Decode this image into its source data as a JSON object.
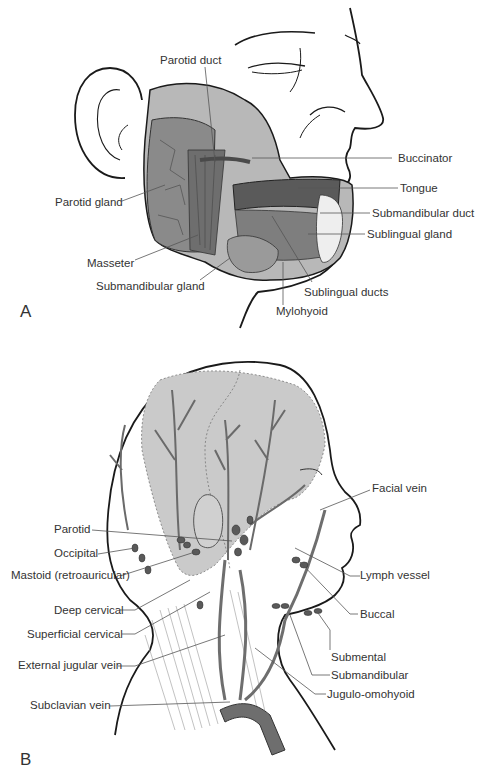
{
  "panel_a": {
    "letter": "A",
    "labels": {
      "parotid_duct": "Parotid duct",
      "buccinator": "Buccinator",
      "tongue": "Tongue",
      "parotid_gland": "Parotid gland",
      "submandibular_duct": "Submandibular duct",
      "sublingual_gland": "Sublingual gland",
      "masseter": "Masseter",
      "submandibular_gland": "Submandibular gland",
      "sublingual_ducts": "Sublingual ducts",
      "mylohyoid": "Mylohyoid"
    }
  },
  "panel_b": {
    "letter": "B",
    "labels": {
      "facial_vein": "Facial vein",
      "parotid": "Parotid",
      "occipital": "Occipital",
      "mastoid": "Mastoid (retroauricular)",
      "lymph_vessel": "Lymph vessel",
      "deep_cervical": "Deep cervical",
      "buccal": "Buccal",
      "superficial_cervical": "Superficial cervical",
      "submental": "Submental",
      "external_jugular_vein": "External jugular vein",
      "submandibular": "Submandibular",
      "jugulo_omohyoid": "Jugulo-omohyoid",
      "subclavian_vein": "Subclavian vein"
    }
  },
  "colors": {
    "line": "#1a1a1a",
    "leader": "#555555",
    "gland_fill": "#8a8a8a",
    "gland_dark": "#5a5a5a",
    "shaded_region": "#c8c8c8",
    "vessel": "#707070"
  }
}
